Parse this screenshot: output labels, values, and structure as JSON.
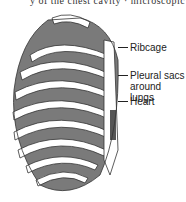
{
  "header": {
    "clipped_text": "y of the chest cavity · microscopic"
  },
  "diagram": {
    "labels": [
      {
        "id": "ribcage",
        "text": "Ribcage"
      },
      {
        "id": "pleural",
        "line1": "Pleural sacs",
        "line2": "around lungs"
      },
      {
        "id": "heart",
        "text": "Heart"
      }
    ],
    "colors": {
      "lung_fill": "#7a7a7a",
      "rib_fill": "#ffffff",
      "outline": "#333333"
    }
  }
}
